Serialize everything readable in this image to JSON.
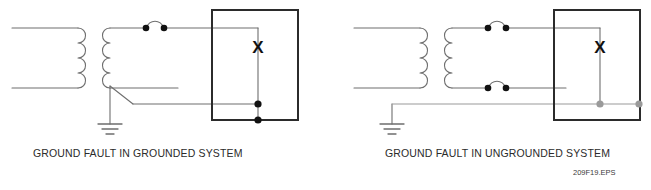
{
  "figure": {
    "file_code": "209F19.EPS",
    "colors": {
      "wire": "#6e6e6e",
      "box": "#2b2b2b",
      "node_black": "#111111",
      "node_gray": "#9a9a9a",
      "gray_wire": "#9a9a9a",
      "text": "#2b2b2b"
    }
  },
  "diagrams": [
    {
      "id": "grounded",
      "caption": "GROUND FAULT IN GROUNDED SYSTEM",
      "load_label": "X",
      "transformer": {
        "primary_label": "",
        "secondary_label": "",
        "coil_turns": 4
      },
      "ground": {
        "present": true,
        "type": "earth-ground"
      },
      "fault": {
        "present": true,
        "description": "fault to grounded neutral"
      },
      "contacts": [
        {
          "id": "upper-contact",
          "type": "wire-hop",
          "dots": 2
        }
      ]
    },
    {
      "id": "ungrounded",
      "caption": "GROUND FAULT IN UNGROUNDED SYSTEM",
      "load_label": "X",
      "transformer": {
        "primary_label": "",
        "secondary_label": "",
        "coil_turns": 4
      },
      "ground": {
        "present": true,
        "type": "earth-ground"
      },
      "fault": {
        "present": true,
        "description": "stray ground path"
      },
      "contacts": [
        {
          "id": "upper-contact",
          "type": "wire-hop",
          "dots": 2
        },
        {
          "id": "lower-contact",
          "type": "wire-hop",
          "dots": 2
        }
      ]
    }
  ]
}
